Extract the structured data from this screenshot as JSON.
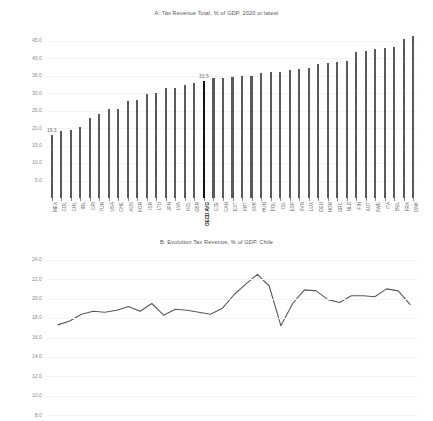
{
  "chart_data": [
    {
      "type": "bar",
      "panel": "A",
      "title": "A: Tax Revenue Total, % of GDP, 2020 or latest",
      "xlabel": "",
      "ylabel": "",
      "ylim": [
        0,
        47.5
      ],
      "yticks": [
        "5.0",
        "10.0",
        "15.0",
        "20.0",
        "25.0",
        "30.0",
        "35.0",
        "40.0",
        "45.0"
      ],
      "ytick_values": [
        5.0,
        10.0,
        15.0,
        20.0,
        25.0,
        30.0,
        35.0,
        40.0,
        45.0
      ],
      "grid": true,
      "legend": "none",
      "bar_color": "#595959",
      "highlight_color": "#121212",
      "highlight_category": "OECD AVG",
      "annotations": [
        {
          "category": "MEX",
          "text": "19.3"
        },
        {
          "category": "OECD AVG",
          "text": "33.5"
        }
      ],
      "categories": [
        "MEX",
        "COL",
        "CHL",
        "IRL",
        "CRI",
        "TUR",
        "USA",
        "CHE",
        "AUS",
        "KOR",
        "ISR",
        "LTU",
        "JPN",
        "LVA",
        "NZL",
        "GBR",
        "OECD AVG",
        "CZE",
        "CAN",
        "EST",
        "PRT",
        "SVK",
        "HUN",
        "POL",
        "ISL",
        "ESP",
        "SVN",
        "LUX",
        "DEU",
        "NOR",
        "GRC",
        "NLD",
        "FIN",
        "AUT",
        "SWE",
        "ITA",
        "BEL",
        "FRA",
        "DNK"
      ],
      "values": [
        17.9,
        19.3,
        19.4,
        20.2,
        22.8,
        23.9,
        25.5,
        25.6,
        27.9,
        28.0,
        29.7,
        30.0,
        31.4,
        31.5,
        32.2,
        32.8,
        33.5,
        34.4,
        34.4,
        34.5,
        34.8,
        34.8,
        35.7,
        36.0,
        36.1,
        36.6,
        36.9,
        37.3,
        38.3,
        38.6,
        38.8,
        39.3,
        41.9,
        42.1,
        42.6,
        42.9,
        43.1,
        45.4,
        46.5
      ]
    },
    {
      "type": "line",
      "panel": "B",
      "title": "B: Evolution Tax Revenue, % of GDP, Chile",
      "xlabel": "",
      "ylabel": "",
      "ylim": [
        7.0,
        24.9
      ],
      "yticks": [
        "8.0",
        "10.0",
        "12.0",
        "14.0",
        "16.0",
        "18.0",
        "20.0",
        "22.0",
        "24.0"
      ],
      "ytick_values": [
        8.0,
        10.0,
        12.0,
        14.0,
        16.0,
        18.0,
        20.0,
        22.0,
        24.0
      ],
      "grid": true,
      "legend": "none",
      "line_color": "#58585a",
      "series_name": "Chile",
      "x": [
        1990,
        1991,
        1992,
        1993,
        1994,
        1995,
        1996,
        1997,
        1998,
        1999,
        2000,
        2001,
        2002,
        2003,
        2004,
        2005,
        2006,
        2007,
        2008,
        2009,
        2010,
        2011,
        2012,
        2013,
        2014,
        2015,
        2016,
        2017,
        2018,
        2019,
        2020
      ],
      "values": [
        17.3,
        17.7,
        18.4,
        18.7,
        18.6,
        18.8,
        19.2,
        18.7,
        19.5,
        18.3,
        18.9,
        18.8,
        18.6,
        18.4,
        19.0,
        20.4,
        21.5,
        22.5,
        21.3,
        17.2,
        19.5,
        20.9,
        20.8,
        19.9,
        19.6,
        20.3,
        20.3,
        20.2,
        21.0,
        20.8,
        19.4
      ]
    }
  ]
}
